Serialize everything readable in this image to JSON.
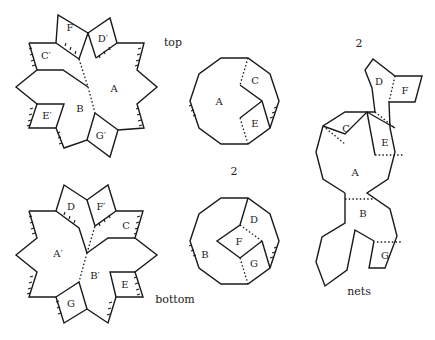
{
  "captions": {
    "top": "top",
    "bottom": "bottom",
    "nets": "nets",
    "count_top_net": "2",
    "count_bottom_dodecagon": "2",
    "count_nets": "2"
  },
  "top_star": {
    "labels": {
      "A": "A",
      "B": "B",
      "C": "C′",
      "D": "D′",
      "E": "E′",
      "F": "F",
      "G": "G′"
    }
  },
  "bottom_star": {
    "labels": {
      "A": "A′",
      "B": "B′",
      "C": "C",
      "D": "D",
      "E": "E",
      "F": "F′",
      "G": "G"
    }
  },
  "dodecagon_top": {
    "labels": {
      "A": "A",
      "C": "C",
      "E": "E"
    }
  },
  "dodecagon_bottom": {
    "labels": {
      "B": "B",
      "D": "D",
      "F": "F",
      "G": "G"
    }
  },
  "net": {
    "labels": {
      "A": "A",
      "B": "B",
      "C": "C",
      "D": "D",
      "E": "E",
      "F": "F",
      "G": "G"
    }
  }
}
